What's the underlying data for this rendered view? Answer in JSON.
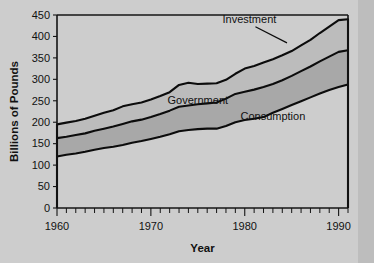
{
  "chart_data": {
    "type": "area",
    "stacked": true,
    "title": "",
    "xlabel": "Year",
    "ylabel": "Billions of Pounds",
    "xlim": [
      1960,
      1991
    ],
    "ylim": [
      0,
      450
    ],
    "ytick_labels": [
      "0",
      "50",
      "100",
      "150",
      "200",
      "250",
      "300",
      "350",
      "400",
      "450"
    ],
    "yticks": [
      0,
      50,
      100,
      150,
      200,
      250,
      300,
      350,
      400,
      450
    ],
    "xtick_labels": [
      "1960",
      "1970",
      "1980",
      "1990"
    ],
    "xticks_major": [
      1960,
      1970,
      1980,
      1990
    ],
    "xticks_minor_step": 1,
    "grid": false,
    "legend_position": "inline-annotations",
    "x": [
      1960,
      1961,
      1962,
      1963,
      1964,
      1965,
      1966,
      1967,
      1968,
      1969,
      1970,
      1971,
      1972,
      1973,
      1974,
      1975,
      1976,
      1977,
      1978,
      1979,
      1980,
      1981,
      1982,
      1983,
      1984,
      1985,
      1986,
      1987,
      1988,
      1989,
      1990,
      1991
    ],
    "series": [
      {
        "name": "Consumption",
        "label": "Consumption",
        "fill": "#cdcdcd",
        "values": [
          120,
          124,
          127,
          131,
          136,
          140,
          143,
          147,
          152,
          156,
          161,
          166,
          172,
          179,
          182,
          184,
          185,
          185,
          191,
          200,
          205,
          208,
          212,
          222,
          231,
          240,
          249,
          258,
          267,
          275,
          282,
          288
        ]
      },
      {
        "name": "Government",
        "label": "Government",
        "fill": "#a8a8a8",
        "values": [
          43,
          42,
          43,
          43,
          44,
          45,
          47,
          49,
          50,
          50,
          51,
          53,
          55,
          57,
          57,
          58,
          59,
          61,
          64,
          66,
          66,
          68,
          70,
          67,
          67,
          68,
          70,
          72,
          75,
          78,
          82,
          80
        ]
      },
      {
        "name": "Investment",
        "label": "Investment",
        "fill": "#bcbcbc",
        "values": [
          32,
          33,
          33,
          34,
          35,
          37,
          38,
          41,
          40,
          40,
          41,
          42,
          43,
          51,
          53,
          47,
          46,
          45,
          44,
          47,
          54,
          55,
          57,
          58,
          58,
          58,
          60,
          62,
          66,
          70,
          74,
          72
        ]
      }
    ],
    "totals_note": {
      "start_total": 195,
      "end_total": 440
    },
    "annotations": [
      {
        "text": "Investment",
        "x": 1980.5,
        "y": 432,
        "leader_to_x": 1984.5,
        "leader_to_y": 385
      },
      {
        "text": "Government",
        "x": 1975.0,
        "y": 243,
        "leader_to_x": null,
        "leader_to_y": null
      },
      {
        "text": "Consumption",
        "x": 1983.0,
        "y": 205,
        "leader_to_x": null,
        "leader_to_y": null
      }
    ]
  }
}
